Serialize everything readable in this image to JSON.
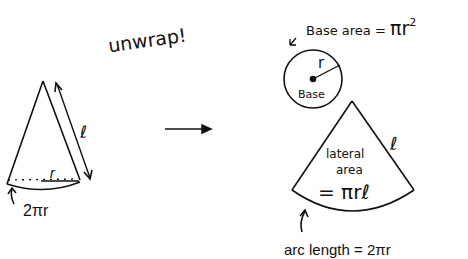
{
  "title_note": "unwrap!",
  "cone": {
    "slant_label": "ℓ",
    "radius_label": "r",
    "circumference_label": "2πr"
  },
  "base_circle": {
    "annotation": "Base area = πr²",
    "annotation_prefix": "Base area = ",
    "annotation_formula": "πr",
    "annotation_exponent": "2",
    "radius_label": "r",
    "inner_label": "Base"
  },
  "sector": {
    "slant_label": "ℓ",
    "inner_line1": "lateral",
    "inner_line2": "area",
    "inner_line3": "= πrℓ",
    "arc_label": "arc length = 2πr"
  },
  "colors": {
    "ink": "#111111",
    "background": "#ffffff"
  }
}
